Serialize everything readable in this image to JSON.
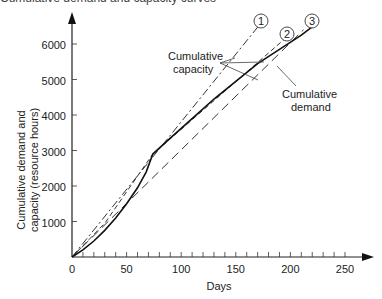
{
  "chart_data": {
    "type": "line",
    "title": "Cumulative demand and capacity curves",
    "xlabel": "Days",
    "ylabel_line1": "Cumulative demand and",
    "ylabel_line2": "capacity (resource hours)",
    "xlim": [
      0,
      270
    ],
    "ylim": [
      0,
      6600
    ],
    "x_ticks": [
      0,
      50,
      100,
      150,
      200,
      250
    ],
    "x_minor_step": 10,
    "y_ticks": [
      1000,
      2000,
      3000,
      4000,
      5000,
      6000
    ],
    "origin_label": "0",
    "grid": false,
    "series": [
      {
        "name": "Cumulative demand",
        "style": "solid",
        "points": [
          [
            0,
            0
          ],
          [
            10,
            200
          ],
          [
            20,
            450
          ],
          [
            30,
            750
          ],
          [
            40,
            1100
          ],
          [
            50,
            1500
          ],
          [
            60,
            1950
          ],
          [
            68,
            2400
          ],
          [
            74,
            2900
          ],
          [
            90,
            3350
          ],
          [
            110,
            3900
          ],
          [
            130,
            4450
          ],
          [
            150,
            4950
          ],
          [
            170,
            5450
          ],
          [
            190,
            5850
          ],
          [
            210,
            6250
          ],
          [
            225,
            6600
          ]
        ]
      },
      {
        "name": "Capacity plan 1",
        "marker_label": "1",
        "style": "dashdot",
        "points": [
          [
            0,
            0
          ],
          [
            172,
            6550
          ]
        ]
      },
      {
        "name": "Capacity plan 2",
        "marker_label": "2",
        "style": "dash-short",
        "points": [
          [
            0,
            0
          ],
          [
            30,
            950
          ],
          [
            74,
            2900
          ],
          [
            195,
            6150
          ]
        ]
      },
      {
        "name": "Capacity plan 3",
        "marker_label": "3",
        "style": "dash-long",
        "points": [
          [
            0,
            0
          ],
          [
            212,
            6400
          ]
        ]
      }
    ],
    "annotations": [
      {
        "text_line1": "Cumulative",
        "text_line2": "capacity",
        "points_to": [
          "Capacity plan 1",
          "Capacity plan 2",
          "Capacity plan 3"
        ]
      },
      {
        "text_line1": "Cumulative",
        "text_line2": "demand",
        "points_to": [
          "Cumulative demand"
        ]
      }
    ]
  },
  "labels": {
    "title": "Cumulative demand and capacity curves",
    "x_tick_0": "0",
    "x_tick_50": "50",
    "x_tick_100": "100",
    "x_tick_150": "150",
    "x_tick_200": "200",
    "x_tick_250": "250",
    "y_tick_1000": "1000",
    "y_tick_2000": "2000",
    "y_tick_3000": "3000",
    "y_tick_4000": "4000",
    "y_tick_5000": "5000",
    "y_tick_6000": "6000",
    "xlabel": "Days",
    "ylabel_line1": "Cumulative demand and",
    "ylabel_line2": "capacity (resource hours)",
    "capacity_annot_1": "Cumulative",
    "capacity_annot_2": "capacity",
    "demand_annot_1": "Cumulative",
    "demand_annot_2": "demand",
    "circle_1": "1",
    "circle_2": "2",
    "circle_3": "3"
  }
}
